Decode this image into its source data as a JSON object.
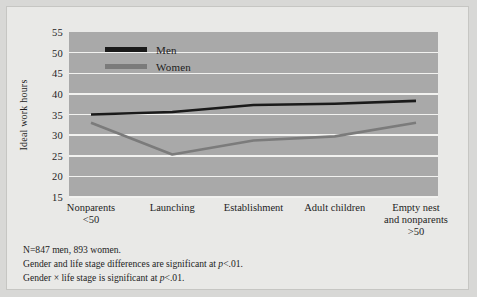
{
  "chart_data": {
    "type": "line",
    "title": "",
    "xlabel": "",
    "ylabel": "Ideal work hours",
    "categories": [
      "Nonparents\n<50",
      "Launching",
      "Establishment",
      "Adult children",
      "Empty nest\nand nonparents\n>50"
    ],
    "category_lines": [
      [
        "Nonparents",
        "<50"
      ],
      [
        "Launching"
      ],
      [
        "Establishment"
      ],
      [
        "Adult children"
      ],
      [
        "Empty nest",
        "and nonparents",
        ">50"
      ]
    ],
    "series": [
      {
        "name": "Men",
        "color": "#1a1a1a",
        "values": [
          35.0,
          35.6,
          37.3,
          37.6,
          38.3
        ]
      },
      {
        "name": "Women",
        "color": "#7b7b7b",
        "values": [
          33.0,
          25.3,
          28.7,
          29.7,
          33.0
        ]
      }
    ],
    "ylim": [
      15,
      55
    ],
    "yticks": [
      55,
      50,
      45,
      40,
      35,
      30,
      25,
      20,
      15
    ],
    "grid": true,
    "legend_position": "upper-left-inside",
    "plot_background": "#a9a9a9",
    "gridline_color": "#f2f2f0",
    "figure_background": "#e9e9e7"
  },
  "legend": {
    "items": [
      {
        "label": "Men"
      },
      {
        "label": "Women"
      }
    ]
  },
  "footnotes": {
    "line1": "N=847 men, 893 women.",
    "line2_a": "Gender and life stage differences are significant at ",
    "line2_p": "p",
    "line2_b": "<.01.",
    "line3_a": "Gender × life stage is significant at ",
    "line3_p": "p",
    "line3_b": "<.01."
  }
}
